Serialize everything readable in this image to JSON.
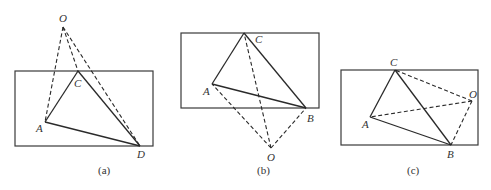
{
  "figures": [
    {
      "id": "a",
      "caption": "(a)",
      "rect": {
        "x": 15,
        "y": 71,
        "w": 138,
        "h": 75
      },
      "points": {
        "O": [
          63,
          27
        ],
        "C": [
          78,
          71
        ],
        "A": [
          45,
          122
        ],
        "D": [
          140,
          146
        ]
      },
      "labels": {
        "O": "O",
        "C": "C",
        "A": "A",
        "D": "D"
      },
      "solid_edges": [
        [
          "A",
          "C"
        ],
        [
          "C",
          "D"
        ],
        [
          "A",
          "D"
        ]
      ],
      "dashed_edges": [
        [
          "O",
          "A"
        ],
        [
          "O",
          "C"
        ],
        [
          "O",
          "D"
        ]
      ]
    },
    {
      "id": "b",
      "caption": "(b)",
      "rect": {
        "x": 181,
        "y": 33,
        "w": 138,
        "h": 75
      },
      "points": {
        "C": [
          244,
          33
        ],
        "A": [
          212,
          84
        ],
        "B": [
          306,
          108
        ],
        "O": [
          271,
          148
        ]
      },
      "labels": {
        "C": "C",
        "A": "A",
        "B": "B",
        "O": "O"
      },
      "solid_edges": [
        [
          "A",
          "C"
        ],
        [
          "C",
          "B"
        ],
        [
          "A",
          "B"
        ]
      ],
      "dashed_edges": [
        [
          "O",
          "A"
        ],
        [
          "O",
          "C"
        ],
        [
          "O",
          "B"
        ]
      ]
    },
    {
      "id": "c",
      "caption": "(c)",
      "rect": {
        "x": 341,
        "y": 70,
        "w": 137,
        "h": 75
      },
      "points": {
        "C": [
          395,
          70
        ],
        "O": [
          472,
          101
        ],
        "A": [
          370,
          117
        ],
        "B": [
          451,
          145
        ]
      },
      "labels": {
        "C": "C",
        "O": "O",
        "A": "A",
        "B": "B"
      },
      "solid_edges": [
        [
          "A",
          "C"
        ],
        [
          "C",
          "B"
        ],
        [
          "A",
          "B"
        ]
      ],
      "dashed_edges": [
        [
          "O",
          "A"
        ],
        [
          "O",
          "C"
        ],
        [
          "O",
          "B"
        ]
      ]
    }
  ]
}
